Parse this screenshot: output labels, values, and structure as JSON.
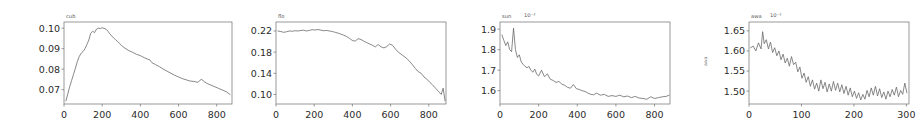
{
  "figure": {
    "background_color": "#ffffff",
    "line_color": "#6a6a6a",
    "axis_color": "#6e6e6e",
    "panel_count": 4
  },
  "chart_data": [
    {
      "type": "line",
      "title": "cub",
      "xlabel": "",
      "ylabel": "",
      "exponent": "",
      "grid": false,
      "legend": null,
      "xlim": [
        0,
        880
      ],
      "ylim": [
        0.063,
        0.103
      ],
      "xticks": [
        0,
        200,
        400,
        600,
        800
      ],
      "yticks": [
        0.07,
        0.08,
        0.09,
        0.1
      ],
      "ytick_labels": [
        "0.07",
        "0.08",
        "0.09",
        "0.10"
      ],
      "xtick_labels": [
        "0",
        "200",
        "400",
        "600",
        "800"
      ],
      "x": [
        10,
        20,
        30,
        40,
        50,
        60,
        70,
        80,
        90,
        100,
        110,
        120,
        130,
        140,
        150,
        160,
        170,
        180,
        190,
        200,
        210,
        220,
        230,
        240,
        250,
        260,
        270,
        280,
        290,
        300,
        320,
        340,
        360,
        380,
        400,
        420,
        440,
        450,
        460,
        480,
        500,
        520,
        540,
        560,
        580,
        600,
        620,
        640,
        660,
        680,
        700,
        710,
        720,
        730,
        750,
        770,
        790,
        810,
        830,
        850,
        870
      ],
      "values": [
        0.0645,
        0.068,
        0.0715,
        0.0745,
        0.0775,
        0.0805,
        0.0838,
        0.0862,
        0.0878,
        0.0886,
        0.09,
        0.092,
        0.0942,
        0.0975,
        0.0985,
        0.0978,
        0.0995,
        0.1,
        0.0998,
        0.1002,
        0.0999,
        0.0995,
        0.0985,
        0.0972,
        0.0962,
        0.0952,
        0.0944,
        0.0936,
        0.0926,
        0.0916,
        0.0902,
        0.089,
        0.0882,
        0.0872,
        0.0866,
        0.0856,
        0.0848,
        0.0845,
        0.0832,
        0.0822,
        0.0812,
        0.08,
        0.079,
        0.078,
        0.077,
        0.0762,
        0.0754,
        0.0748,
        0.0742,
        0.074,
        0.0736,
        0.0742,
        0.0752,
        0.0742,
        0.073,
        0.0722,
        0.0714,
        0.0706,
        0.0698,
        0.069,
        0.0676
      ]
    },
    {
      "type": "line",
      "title": "flo",
      "xlabel": "",
      "ylabel": "",
      "exponent": "",
      "grid": false,
      "legend": null,
      "xlim": [
        0,
        890
      ],
      "ylim": [
        0.082,
        0.237
      ],
      "xticks": [
        0,
        200,
        400,
        600,
        800
      ],
      "yticks": [
        0.1,
        0.14,
        0.18,
        0.22
      ],
      "ytick_labels": [
        "0.10",
        "0.14",
        "0.18",
        "0.22"
      ],
      "xtick_labels": [
        "0",
        "200",
        "400",
        "600",
        "800"
      ],
      "x": [
        10,
        25,
        40,
        55,
        70,
        85,
        100,
        115,
        130,
        145,
        160,
        175,
        190,
        205,
        220,
        235,
        250,
        265,
        280,
        295,
        310,
        325,
        340,
        355,
        370,
        385,
        400,
        415,
        430,
        445,
        460,
        475,
        490,
        505,
        520,
        535,
        550,
        565,
        580,
        595,
        610,
        625,
        640,
        655,
        670,
        685,
        700,
        715,
        730,
        745,
        760,
        775,
        790,
        805,
        820,
        835,
        850,
        865,
        875,
        885
      ],
      "values": [
        0.22,
        0.219,
        0.2175,
        0.2185,
        0.22,
        0.2195,
        0.2205,
        0.22,
        0.221,
        0.2215,
        0.22,
        0.2212,
        0.2225,
        0.2218,
        0.2228,
        0.2215,
        0.2205,
        0.221,
        0.22,
        0.219,
        0.2175,
        0.216,
        0.214,
        0.212,
        0.2095,
        0.206,
        0.202,
        0.201,
        0.2055,
        0.204,
        0.2005,
        0.198,
        0.1955,
        0.193,
        0.19,
        0.1945,
        0.19,
        0.188,
        0.1905,
        0.1955,
        0.193,
        0.186,
        0.18,
        0.176,
        0.172,
        0.168,
        0.162,
        0.156,
        0.149,
        0.143,
        0.14,
        0.133,
        0.129,
        0.123,
        0.118,
        0.112,
        0.106,
        0.1,
        0.112,
        0.088
      ]
    },
    {
      "type": "line",
      "title": "sun",
      "xlabel": "",
      "ylabel": "",
      "exponent": "10⁻³",
      "grid": false,
      "legend": null,
      "xlim": [
        0,
        880
      ],
      "ylim": [
        1.535,
        1.935
      ],
      "xticks": [
        0,
        200,
        400,
        600,
        800
      ],
      "yticks": [
        1.6,
        1.7,
        1.8,
        1.9
      ],
      "ytick_labels": [
        "1.6",
        "1.7",
        "1.8",
        "1.9"
      ],
      "xtick_labels": [
        "0",
        "200",
        "400",
        "600",
        "800"
      ],
      "x": [
        10,
        20,
        30,
        40,
        50,
        60,
        70,
        80,
        90,
        100,
        110,
        120,
        130,
        140,
        150,
        160,
        170,
        180,
        190,
        200,
        215,
        230,
        245,
        260,
        275,
        290,
        305,
        320,
        335,
        350,
        365,
        380,
        395,
        410,
        425,
        440,
        455,
        470,
        485,
        500,
        520,
        540,
        560,
        580,
        600,
        620,
        640,
        660,
        680,
        700,
        720,
        740,
        760,
        780,
        800,
        820,
        840,
        860,
        875
      ],
      "values": [
        1.872,
        1.845,
        1.82,
        1.838,
        1.8,
        1.79,
        1.905,
        1.8,
        1.762,
        1.775,
        1.74,
        1.728,
        1.718,
        1.712,
        1.718,
        1.7,
        1.69,
        1.705,
        1.68,
        1.672,
        1.7,
        1.668,
        1.682,
        1.656,
        1.65,
        1.64,
        1.645,
        1.632,
        1.626,
        1.616,
        1.612,
        1.63,
        1.61,
        1.606,
        1.6,
        1.596,
        1.588,
        1.582,
        1.58,
        1.588,
        1.578,
        1.582,
        1.572,
        1.576,
        1.572,
        1.578,
        1.57,
        1.574,
        1.566,
        1.572,
        1.564,
        1.562,
        1.558,
        1.57,
        1.562,
        1.566,
        1.57,
        1.572,
        1.578
      ]
    },
    {
      "type": "line",
      "title": "awa",
      "xlabel": "",
      "ylabel": "awa",
      "exponent": "10⁻³",
      "grid": false,
      "legend": null,
      "xlim": [
        0,
        305
      ],
      "ylim": [
        1.468,
        1.672
      ],
      "xticks": [
        0,
        100,
        200,
        300
      ],
      "yticks": [
        1.5,
        1.55,
        1.6,
        1.65
      ],
      "ytick_labels": [
        "1.50",
        "1.55",
        "1.60",
        "1.65"
      ],
      "xtick_labels": [
        "0",
        "100",
        "200",
        "300"
      ],
      "x": [
        3,
        8,
        13,
        18,
        23,
        26,
        29,
        33,
        37,
        41,
        45,
        49,
        53,
        57,
        61,
        65,
        69,
        73,
        77,
        81,
        85,
        89,
        93,
        97,
        101,
        105,
        109,
        113,
        117,
        121,
        125,
        129,
        133,
        137,
        141,
        145,
        149,
        153,
        157,
        161,
        165,
        169,
        173,
        177,
        181,
        185,
        189,
        193,
        197,
        201,
        205,
        209,
        213,
        217,
        221,
        225,
        229,
        233,
        237,
        241,
        245,
        249,
        253,
        257,
        261,
        265,
        269,
        273,
        277,
        281,
        285,
        289,
        293,
        297,
        301
      ],
      "values": [
        1.608,
        1.612,
        1.6,
        1.62,
        1.605,
        1.648,
        1.618,
        1.628,
        1.605,
        1.622,
        1.596,
        1.608,
        1.588,
        1.6,
        1.578,
        1.592,
        1.57,
        1.582,
        1.562,
        1.586,
        1.566,
        1.572,
        1.548,
        1.56,
        1.532,
        1.545,
        1.522,
        1.536,
        1.512,
        1.528,
        1.505,
        1.52,
        1.5,
        1.528,
        1.506,
        1.522,
        1.498,
        1.518,
        1.5,
        1.524,
        1.502,
        1.52,
        1.498,
        1.516,
        1.494,
        1.512,
        1.49,
        1.508,
        1.486,
        1.5,
        1.482,
        1.496,
        1.478,
        1.492,
        1.48,
        1.502,
        1.486,
        1.508,
        1.49,
        1.512,
        1.488,
        1.506,
        1.484,
        1.498,
        1.48,
        1.5,
        1.486,
        1.504,
        1.49,
        1.51,
        1.486,
        1.502,
        1.492,
        1.52,
        1.496
      ]
    }
  ]
}
